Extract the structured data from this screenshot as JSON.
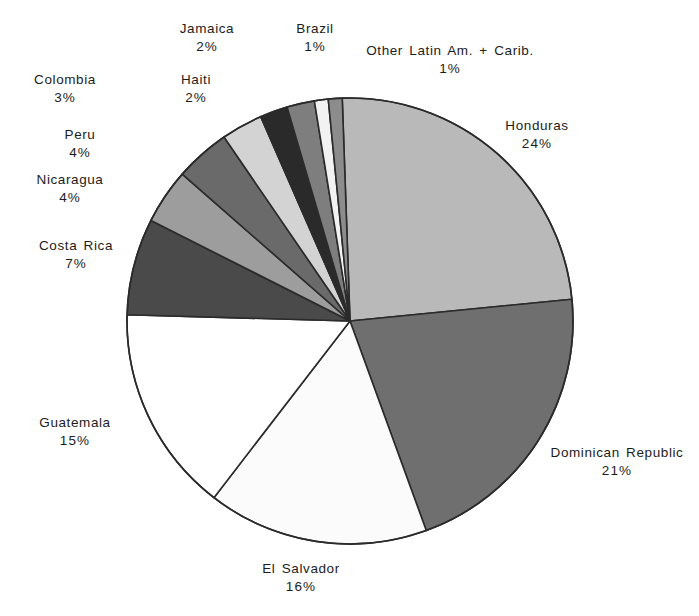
{
  "chart_data": {
    "type": "pie",
    "title": "",
    "subtitle": "",
    "xlabel": "",
    "ylabel": "",
    "legend_position": "none",
    "grid": false,
    "value_unit": "%",
    "start_angle_deg": 0,
    "direction": "clockwise",
    "categories": [
      "Honduras",
      "Dominican Republic",
      "El Salvador",
      "Guatemala",
      "Costa Rica",
      "Nicaragua",
      "Peru",
      "Colombia",
      "Haiti",
      "Jamaica",
      "Brazil",
      "Other Latin Am. + Carib."
    ],
    "values": [
      24,
      21,
      16,
      15,
      7,
      4,
      4,
      3,
      2,
      2,
      1,
      1
    ],
    "labels": [
      "24%",
      "21%",
      "16%",
      "15%",
      "7%",
      "4%",
      "4%",
      "3%",
      "2%",
      "2%",
      "1%",
      "1%"
    ],
    "colors": [
      "#b9b9b9",
      "#6f6f6f",
      "#fbfbfb",
      "#ffffff",
      "#4a4a4a",
      "#9d9d9d",
      "#6a6a6a",
      "#d3d3d3",
      "#2a2a2a",
      "#7e7e7e",
      "#f2f2f2",
      "#8c8c8c"
    ],
    "stroke_color": "#2b2b2b",
    "slices": [
      {
        "name": "Honduras",
        "value": 24,
        "label": "24%",
        "color": "#b9b9b9"
      },
      {
        "name": "Dominican Republic",
        "value": 21,
        "label": "21%",
        "color": "#6f6f6f"
      },
      {
        "name": "El Salvador",
        "value": 16,
        "label": "16%",
        "color": "#fbfbfb"
      },
      {
        "name": "Guatemala",
        "value": 15,
        "label": "15%",
        "color": "#ffffff"
      },
      {
        "name": "Costa Rica",
        "value": 7,
        "label": "7%",
        "color": "#4a4a4a"
      },
      {
        "name": "Nicaragua",
        "value": 4,
        "label": "4%",
        "color": "#9d9d9d"
      },
      {
        "name": "Peru",
        "value": 4,
        "label": "4%",
        "color": "#6a6a6a"
      },
      {
        "name": "Colombia",
        "value": 3,
        "label": "3%",
        "color": "#d3d3d3"
      },
      {
        "name": "Haiti",
        "value": 2,
        "label": "2%",
        "color": "#2a2a2a"
      },
      {
        "name": "Jamaica",
        "value": 2,
        "label": "2%",
        "color": "#7e7e7e"
      },
      {
        "name": "Brazil",
        "value": 1,
        "label": "1%",
        "color": "#f2f2f2"
      },
      {
        "name": "Other Latin Am. + Carib.",
        "value": 1,
        "label": "1%",
        "color": "#8c8c8c"
      }
    ]
  },
  "geometry": {
    "center_x": 350,
    "center_y": 321,
    "radius": 223
  },
  "callouts": [
    {
      "key": "jamaica",
      "name": "Jamaica",
      "pct": "2%",
      "x": 207,
      "y": 20
    },
    {
      "key": "brazil",
      "name": "Brazil",
      "pct": "1%",
      "x": 315,
      "y": 20
    },
    {
      "key": "other",
      "name": "Other Latin Am. + Carib.",
      "pct": "1%",
      "x": 450,
      "y": 42
    },
    {
      "key": "colombia",
      "name": "Colombia",
      "pct": "3%",
      "x": 65,
      "y": 71
    },
    {
      "key": "haiti",
      "name": "Haiti",
      "pct": "2%",
      "x": 196,
      "y": 71
    },
    {
      "key": "peru",
      "name": "Peru",
      "pct": "4%",
      "x": 80,
      "y": 126
    },
    {
      "key": "nicaragua",
      "name": "Nicaragua",
      "pct": "4%",
      "x": 70,
      "y": 171
    },
    {
      "key": "costarica",
      "name": "Costa Rica",
      "pct": "7%",
      "x": 76,
      "y": 237
    },
    {
      "key": "honduras",
      "name": "Honduras",
      "pct": "24%",
      "x": 537,
      "y": 117
    },
    {
      "key": "domrep",
      "name": "Dominican Republic",
      "pct": "21%",
      "x": 617,
      "y": 444
    },
    {
      "key": "guatemala",
      "name": "Guatemala",
      "pct": "15%",
      "x": 75,
      "y": 414
    },
    {
      "key": "elsalvador",
      "name": "El Salvador",
      "pct": "16%",
      "x": 301,
      "y": 560
    }
  ]
}
